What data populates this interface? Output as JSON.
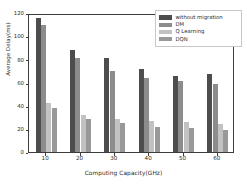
{
  "chart_data": {
    "type": "bar",
    "title": "",
    "xlabel": "Computing Capacity(GHz)",
    "ylabel": "Average Delay(ms)",
    "categories": [
      "10",
      "20",
      "30",
      "40",
      "50",
      "60"
    ],
    "ylim": [
      0,
      120
    ],
    "yticks": [
      0,
      20,
      40,
      60,
      80,
      100,
      120
    ],
    "grid": false,
    "legend_position": "upper right",
    "series": [
      {
        "name": "without migration",
        "color": "#4d4d4d",
        "values": [
          116,
          88,
          81,
          72,
          66,
          67.5
        ]
      },
      {
        "name": "DM",
        "color": "#8c8c8c",
        "values": [
          110,
          81,
          70,
          64,
          61.5,
          58.5
        ]
      },
      {
        "name": "Q Learning",
        "color": "#c2c2c2",
        "values": [
          42,
          32,
          28.5,
          26.5,
          26,
          24.5
        ]
      },
      {
        "name": "DQN",
        "color": "#999999",
        "values": [
          38,
          28.5,
          25,
          21.5,
          20.5,
          19
        ]
      }
    ]
  },
  "axes": {
    "frame_color": "#3c3c3c",
    "tick_color": "#3c3c3c",
    "text_color": "#2b2b2b"
  }
}
